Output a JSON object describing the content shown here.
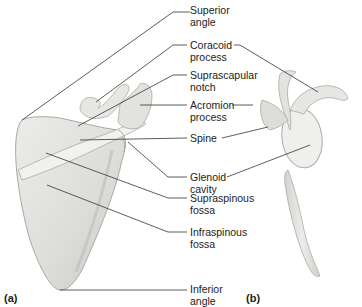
{
  "figure": {
    "panels": [
      {
        "id": "a",
        "label": "(a)"
      },
      {
        "id": "b",
        "label": "(b)"
      }
    ],
    "labels": [
      {
        "id": "superior-angle",
        "line1": "Superior",
        "line2": "angle"
      },
      {
        "id": "coracoid-process",
        "line1": "Coracoid",
        "line2": "process"
      },
      {
        "id": "suprascapular-notch",
        "line1": "Suprascapular",
        "line2": "notch"
      },
      {
        "id": "acromion-process",
        "line1": "Acromion",
        "line2": "process"
      },
      {
        "id": "spine",
        "line1": "Spine",
        "line2": ""
      },
      {
        "id": "glenoid-cavity",
        "line1": "Glenoid",
        "line2": "cavity"
      },
      {
        "id": "supraspinous-fossa",
        "line1": "Supraspinous",
        "line2": "fossa"
      },
      {
        "id": "infraspinous-fossa",
        "line1": "Infraspinous",
        "line2": "fossa"
      },
      {
        "id": "inferior-angle",
        "line1": "Inferior",
        "line2": "angle"
      }
    ],
    "colors": {
      "bone_fill": "#e4e4e2",
      "bone_shade": "#c9c9c6",
      "bone_edge": "#a9a9a5",
      "leader_line": "#333333",
      "text": "#222222"
    }
  }
}
